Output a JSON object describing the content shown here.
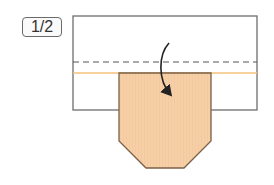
{
  "step": {
    "label": "1/2"
  },
  "colors": {
    "paper_fill": "#ffffff",
    "paper_stroke": "#6e6e6e",
    "flap_fill": "#f6cfa6",
    "flap_stroke": "#7a6048",
    "fold_line_orange": "#f5c27a",
    "dashed_line": "#555555",
    "arrow": "#222222"
  },
  "diagram": {
    "rectangle": {
      "x": 73,
      "y": 16,
      "width": 184,
      "height": 94
    },
    "dashed_fold_line_y": 62,
    "orange_crease_y": 73,
    "flap_points": "119,73 211,73 211,141 184,168 146,168 119,141",
    "arrow_path": "M169,43 C158,55 158,80 170,94",
    "instruction_icon": "fold-down-arrow"
  }
}
